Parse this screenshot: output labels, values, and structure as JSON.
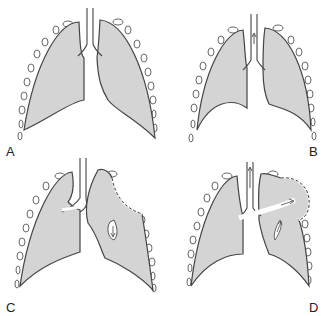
{
  "figure": {
    "panels": [
      {
        "id": "A",
        "label": "A",
        "description": "Normal lungs at rest"
      },
      {
        "id": "B",
        "label": "B",
        "description": "Lungs with air flow arrow in trachea"
      },
      {
        "id": "C",
        "label": "C",
        "description": "Left lung with chest wall defect (dashed), paradoxical movement"
      },
      {
        "id": "D",
        "label": "D",
        "description": "Left lung bulging through chest wall defect with pendelluft arrow"
      }
    ],
    "colors": {
      "lung_fill": "#d4d4d4",
      "outline": "#444444",
      "background": "#ffffff"
    }
  }
}
